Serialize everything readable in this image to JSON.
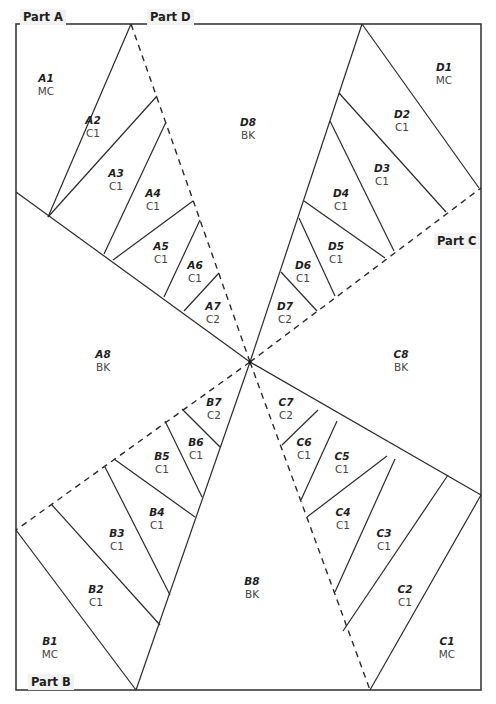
{
  "parts": [
    {
      "id": "A",
      "label": "Part A",
      "x": 20,
      "y": 9
    },
    {
      "id": "D",
      "label": "Part D",
      "x": 147,
      "y": 9
    },
    {
      "id": "C",
      "label": "Part C",
      "x": 434,
      "y": 233
    },
    {
      "id": "B",
      "label": "Part B",
      "x": 28,
      "y": 674
    }
  ],
  "pieces": [
    {
      "id": "A1",
      "color": "MC",
      "x": 46,
      "y": 85
    },
    {
      "id": "A2",
      "color": "C1",
      "x": 93,
      "y": 127
    },
    {
      "id": "A3",
      "color": "C1",
      "x": 116,
      "y": 180
    },
    {
      "id": "A4",
      "color": "C1",
      "x": 153,
      "y": 200
    },
    {
      "id": "A5",
      "color": "C1",
      "x": 161,
      "y": 253
    },
    {
      "id": "A6",
      "color": "C1",
      "x": 195,
      "y": 272
    },
    {
      "id": "A7",
      "color": "C2",
      "x": 213,
      "y": 313
    },
    {
      "id": "A8",
      "color": "BK",
      "x": 103,
      "y": 361
    },
    {
      "id": "D1",
      "color": "MC",
      "x": 444,
      "y": 74
    },
    {
      "id": "D2",
      "color": "C1",
      "x": 402,
      "y": 121
    },
    {
      "id": "D3",
      "color": "C1",
      "x": 382,
      "y": 175
    },
    {
      "id": "D4",
      "color": "C1",
      "x": 341,
      "y": 200
    },
    {
      "id": "D5",
      "color": "C1",
      "x": 336,
      "y": 253
    },
    {
      "id": "D6",
      "color": "C1",
      "x": 303,
      "y": 272
    },
    {
      "id": "D7",
      "color": "C2",
      "x": 285,
      "y": 313
    },
    {
      "id": "D8",
      "color": "BK",
      "x": 248,
      "y": 129
    },
    {
      "id": "C8",
      "color": "BK",
      "x": 401,
      "y": 361
    },
    {
      "id": "C7",
      "color": "C2",
      "x": 286,
      "y": 409
    },
    {
      "id": "C6",
      "color": "C1",
      "x": 304,
      "y": 449
    },
    {
      "id": "C5",
      "color": "C1",
      "x": 342,
      "y": 463
    },
    {
      "id": "C4",
      "color": "C1",
      "x": 343,
      "y": 519
    },
    {
      "id": "C3",
      "color": "C1",
      "x": 384,
      "y": 540
    },
    {
      "id": "C2",
      "color": "C1",
      "x": 405,
      "y": 596
    },
    {
      "id": "C1",
      "color": "MC",
      "x": 447,
      "y": 648
    },
    {
      "id": "B7",
      "color": "C2",
      "x": 214,
      "y": 409
    },
    {
      "id": "B6",
      "color": "C1",
      "x": 196,
      "y": 449
    },
    {
      "id": "B5",
      "color": "C1",
      "x": 162,
      "y": 463
    },
    {
      "id": "B4",
      "color": "C1",
      "x": 157,
      "y": 519
    },
    {
      "id": "B3",
      "color": "C1",
      "x": 117,
      "y": 540
    },
    {
      "id": "B2",
      "color": "C1",
      "x": 96,
      "y": 596
    },
    {
      "id": "B1",
      "color": "MC",
      "x": 50,
      "y": 648
    },
    {
      "id": "B8",
      "color": "BK",
      "x": 252,
      "y": 588
    }
  ]
}
